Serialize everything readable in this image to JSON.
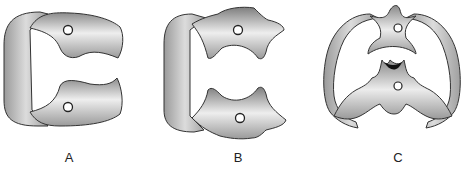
{
  "figure": {
    "panels": [
      {
        "label": "A",
        "description": "Clamp with straight jaws and bow"
      },
      {
        "label": "B",
        "description": "Clamp with notched winged jaws and bow"
      },
      {
        "label": "C",
        "description": "Butterfly clamp with double bow"
      }
    ],
    "colors": {
      "metal_light": "#e6e6e6",
      "metal_dark": "#8a8a8a",
      "outline": "#333333"
    }
  }
}
